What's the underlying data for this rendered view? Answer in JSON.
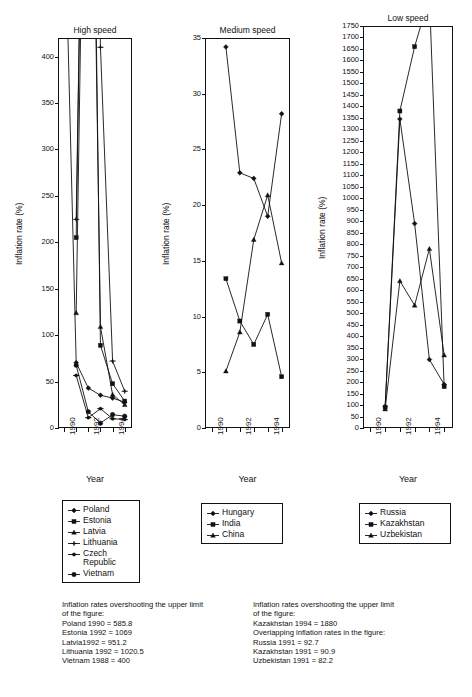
{
  "figure": {
    "axis_label_y": "Inflation rate (%)",
    "axis_label_x": "Year"
  },
  "chart_data": [
    {
      "type": "line",
      "title": "High speed",
      "xlabel": "Year",
      "ylabel": "Inflation rate (%)",
      "xlim": [
        1989.5,
        1995.6
      ],
      "ylim": [
        0,
        420
      ],
      "yticks": [
        0,
        50,
        100,
        150,
        200,
        250,
        300,
        350,
        400
      ],
      "xticks": [
        1990,
        1991,
        1992,
        1993,
        1994,
        1995
      ],
      "xticklabels": [
        "1990",
        "",
        "1992",
        "",
        "1994",
        ""
      ],
      "grid": false,
      "legend_position": "below",
      "series": [
        {
          "name": "Poland",
          "marker": "diamond",
          "x": [
            1990,
            1991,
            1992,
            1993,
            1994,
            1995
          ],
          "y": [
            585.8,
            70.3,
            43.0,
            35.3,
            32.2,
            27.8
          ]
        },
        {
          "name": "Estonia",
          "marker": "square",
          "x": [
            1991,
            1992,
            1993,
            1994,
            1995
          ],
          "y": [
            205.0,
            1069,
            89.0,
            47.7,
            29.0
          ]
        },
        {
          "name": "Latvia",
          "marker": "triangle",
          "x": [
            1991,
            1992,
            1993,
            1994,
            1995
          ],
          "y": [
            124.0,
            951.2,
            109.0,
            35.9,
            25.0
          ]
        },
        {
          "name": "Lithuania",
          "marker": "cross",
          "x": [
            1991,
            1992,
            1993,
            1994,
            1995
          ],
          "y": [
            224.7,
            1020.5,
            410.0,
            72.1,
            39.6
          ]
        },
        {
          "name": "Czech Republic",
          "marker": "dash",
          "x": [
            1991,
            1992,
            1993,
            1994,
            1995
          ],
          "y": [
            56.6,
            11.1,
            20.8,
            10.0,
            9.1
          ]
        },
        {
          "name": "Vietnam",
          "marker": "circle",
          "x": [
            1991,
            1992,
            1993,
            1994,
            1995
          ],
          "y": [
            67.5,
            17.5,
            5.2,
            14.4,
            12.7
          ]
        }
      ],
      "legend_items": [
        {
          "label": "Poland",
          "marker": "diamond"
        },
        {
          "label": "Estonia",
          "marker": "square"
        },
        {
          "label": "Latvia",
          "marker": "triangle"
        },
        {
          "label": "Lithuania",
          "marker": "cross"
        },
        {
          "label": "Czech\nRepublic",
          "marker": "dash"
        },
        {
          "label": "Vietnam",
          "marker": "circle"
        }
      ],
      "note": "Inflation rates overshooting the upper limit\nof the figure:\nPoland 1990 = 585.8\nEstonia 1992 = 1069\nLatvia1992 = 951.2\nLithuania 1992 = 1020.5\nVietnam 1988 = 400"
    },
    {
      "type": "line",
      "title": "Medium speed",
      "xlabel": "Year",
      "ylabel": "Inflation rate (%)",
      "xlim": [
        1989.5,
        1995.6
      ],
      "ylim": [
        0,
        35
      ],
      "yticks": [
        0,
        5,
        10,
        15,
        20,
        25,
        30,
        35
      ],
      "xticks": [
        1990,
        1991,
        1992,
        1993,
        1994,
        1995
      ],
      "xticklabels": [
        "1990",
        "",
        "1992",
        "",
        "1994",
        ""
      ],
      "grid": false,
      "legend_position": "below",
      "series": [
        {
          "name": "Hungary",
          "marker": "diamond",
          "x": [
            1991,
            1992,
            1993,
            1994,
            1995
          ],
          "y": [
            34.2,
            22.9,
            22.4,
            19.0,
            28.2
          ]
        },
        {
          "name": "India",
          "marker": "square",
          "x": [
            1991,
            1992,
            1993,
            1994,
            1995
          ],
          "y": [
            13.4,
            9.6,
            7.5,
            10.2,
            4.6
          ]
        },
        {
          "name": "China",
          "marker": "triangle",
          "x": [
            1991,
            1992,
            1993,
            1994,
            1995
          ],
          "y": [
            5.1,
            8.6,
            16.9,
            20.9,
            14.8
          ]
        }
      ],
      "legend_items": [
        {
          "label": "Hungary",
          "marker": "diamond"
        },
        {
          "label": "India",
          "marker": "square"
        },
        {
          "label": "China",
          "marker": "triangle"
        }
      ],
      "note": ""
    },
    {
      "type": "line",
      "title": "Low speed",
      "xlabel": "Year",
      "ylabel": "Inflation rate (%)",
      "xlim": [
        1989.5,
        1995.6
      ],
      "ylim": [
        0,
        1750
      ],
      "yticks": [
        0,
        50,
        100,
        150,
        200,
        250,
        300,
        350,
        400,
        450,
        500,
        550,
        600,
        650,
        700,
        750,
        800,
        850,
        900,
        950,
        1000,
        1050,
        1100,
        1150,
        1200,
        1250,
        1300,
        1350,
        1400,
        1450,
        1500,
        1550,
        1600,
        1650,
        1700,
        1750
      ],
      "xticks": [
        1990,
        1991,
        1992,
        1993,
        1994,
        1995
      ],
      "xticklabels": [
        "1990",
        "",
        "1992",
        "",
        "1994",
        ""
      ],
      "grid": false,
      "legend_position": "below",
      "series": [
        {
          "name": "Russia",
          "marker": "diamond",
          "x": [
            1991,
            1992,
            1993,
            1994,
            1995
          ],
          "y": [
            92.7,
            1345,
            890,
            298,
            190
          ]
        },
        {
          "name": "Kazakhstan",
          "marker": "square",
          "x": [
            1991,
            1992,
            1993,
            1994,
            1995
          ],
          "y": [
            90.9,
            1380,
            1660,
            1880,
            180
          ]
        },
        {
          "name": "Uzbekistan",
          "marker": "triangle",
          "x": [
            1991,
            1992,
            1993,
            1994,
            1995
          ],
          "y": [
            82.2,
            640,
            534,
            780,
            317
          ]
        }
      ],
      "legend_items": [
        {
          "label": "Russia",
          "marker": "diamond"
        },
        {
          "label": "Kazakhstan",
          "marker": "square"
        },
        {
          "label": "Uzbekistan",
          "marker": "triangle"
        }
      ],
      "note": "Inflation rates overshooting the upper limit\nof the figure:\nKazakhstan 1994 = 1880\nOverlapping inflation rates in the figure:\nRussia 1991 = 92.7\nKazakhstan 1991 = 90.9\nUzbekistan 1991 = 82.2"
    }
  ]
}
